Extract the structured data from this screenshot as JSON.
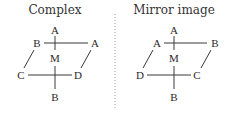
{
  "panels": [
    {
      "title": "Complex",
      "labels": {
        "top": "A",
        "upper_left": "B",
        "upper_right": "A",
        "center": "M",
        "lower_left": "C",
        "lower_right": "D",
        "bottom": "B"
      }
    },
    {
      "title": "Mirror image",
      "labels": {
        "top": "A",
        "upper_left": "A",
        "upper_right": "B",
        "center": "M",
        "lower_left": "D",
        "lower_right": "C",
        "bottom": "B"
      }
    }
  ],
  "colors": {
    "text": "#2a2a2a",
    "lines": "#3a3a3a",
    "divider": "#9a9a9a"
  }
}
